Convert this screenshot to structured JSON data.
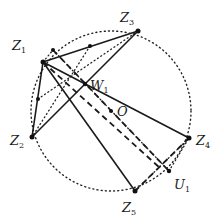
{
  "diagram": {
    "circle": {
      "cx": 111,
      "cy": 111,
      "r": 80,
      "style": "dotted"
    },
    "points": {
      "Z1": {
        "x": 43,
        "y": 62,
        "label": "Z",
        "sub": "1",
        "lx": 12,
        "ly": 50
      },
      "Z2": {
        "x": 32,
        "y": 137,
        "label": "Z",
        "sub": "2",
        "lx": 10,
        "ly": 145
      },
      "Z3": {
        "x": 138,
        "y": 31,
        "label": "Z",
        "sub": "3",
        "lx": 120,
        "ly": 22
      },
      "Z4": {
        "x": 189,
        "y": 138,
        "label": "Z",
        "sub": "4",
        "lx": 196,
        "ly": 145
      },
      "Z5": {
        "x": 135,
        "y": 191,
        "label": "Z",
        "sub": "5",
        "lx": 122,
        "ly": 212
      },
      "W1": {
        "x": 85,
        "y": 84,
        "label": "W",
        "sub": "1",
        "lx": 90,
        "ly": 90
      },
      "O": {
        "x": 111,
        "y": 111,
        "label": "O",
        "sub": "",
        "lx": 117,
        "ly": 116
      },
      "U1": {
        "x": 169,
        "y": 171,
        "label": "U",
        "sub": "1",
        "lx": 174,
        "ly": 189
      }
    },
    "extra_dots": [
      {
        "x": 90,
        "y": 46
      },
      {
        "x": 38,
        "y": 99
      },
      {
        "x": 53,
        "y": 50
      }
    ]
  }
}
